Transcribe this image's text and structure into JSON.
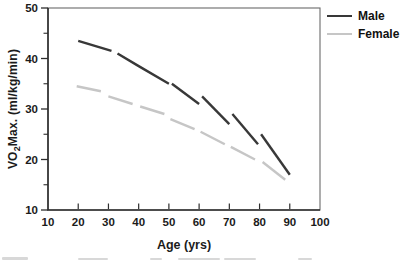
{
  "chart_data": {
    "type": "line",
    "title": "",
    "xlabel": "Age (yrs)",
    "ylabel": "VO2Max. (ml/kg/min)",
    "ylabel_parts": {
      "pre": "VO",
      "sub": "2",
      "post": "Max. (ml/kg/min)"
    },
    "xlim": [
      10,
      100
    ],
    "ylim": [
      10,
      50
    ],
    "x_ticks": [
      10,
      20,
      30,
      40,
      50,
      60,
      70,
      80,
      90,
      100
    ],
    "y_ticks_major": [
      10,
      20,
      30,
      40,
      50
    ],
    "y_ticks_minor": [
      15,
      25,
      35,
      45
    ],
    "grid": false,
    "legend_position": "outside-top-right",
    "axis_color": "#2e2e2e",
    "series": [
      {
        "name": "Male",
        "color": "#383838",
        "line_style": "dashed-segments",
        "segments": [
          [
            [
              20,
              43.5
            ],
            [
              31,
              41.5
            ]
          ],
          [
            [
              33,
              41
            ],
            [
              40,
              38.5
            ],
            [
              50,
              35
            ]
          ],
          [
            [
              51,
              35
            ],
            [
              60,
              31
            ]
          ],
          [
            [
              61,
              32.5
            ],
            [
              70,
              27
            ]
          ],
          [
            [
              71,
              29
            ],
            [
              79.5,
              23
            ]
          ],
          [
            [
              80.5,
              25
            ],
            [
              90,
              17
            ]
          ]
        ]
      },
      {
        "name": "Female",
        "color": "#c6c6c6",
        "line_style": "dashed-segments",
        "segments": [
          [
            [
              19.5,
              34.5
            ],
            [
              27.5,
              33.5
            ]
          ],
          [
            [
              30,
              32.5
            ],
            [
              38,
              31
            ]
          ],
          [
            [
              40.5,
              30.5
            ],
            [
              48.5,
              29
            ]
          ],
          [
            [
              50.5,
              28
            ],
            [
              58.5,
              26
            ]
          ],
          [
            [
              60.5,
              25.5
            ],
            [
              68.5,
              23
            ]
          ],
          [
            [
              70.5,
              22.5
            ],
            [
              78.5,
              20
            ]
          ],
          [
            [
              81,
              19.5
            ],
            [
              88.5,
              16
            ]
          ]
        ]
      }
    ]
  }
}
